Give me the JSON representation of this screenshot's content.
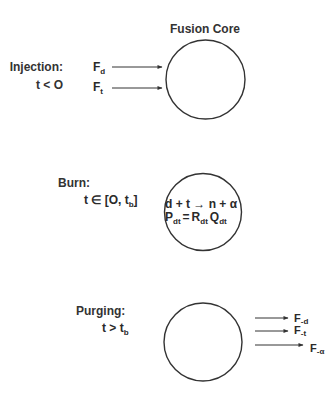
{
  "title": "Fusion Core",
  "phases": [
    {
      "id": "injection",
      "label": "Injection:",
      "condition": "t < O",
      "flows_in": [
        {
          "symbol": "F",
          "subscript": "d"
        },
        {
          "symbol": "F",
          "subscript": "t"
        }
      ]
    },
    {
      "id": "burn",
      "label": "Burn:",
      "condition_main": "t ∈ [O, t",
      "condition_sub": "b",
      "condition_end": "]",
      "reaction": "d + t → n + α",
      "power": {
        "lhs": "P",
        "lhs_sub": "dt",
        "eq": "=",
        "r": "R",
        "r_sub": "dt",
        "q": "Q",
        "q_sub": "dt"
      }
    },
    {
      "id": "purging",
      "label": "Purging:",
      "condition_main": "t > t",
      "condition_sub": "b",
      "flows_out": [
        {
          "symbol": "F",
          "subscript": "-d"
        },
        {
          "symbol": "F",
          "subscript": "-t"
        },
        {
          "symbol": "F",
          "subscript": "-α"
        }
      ]
    }
  ]
}
